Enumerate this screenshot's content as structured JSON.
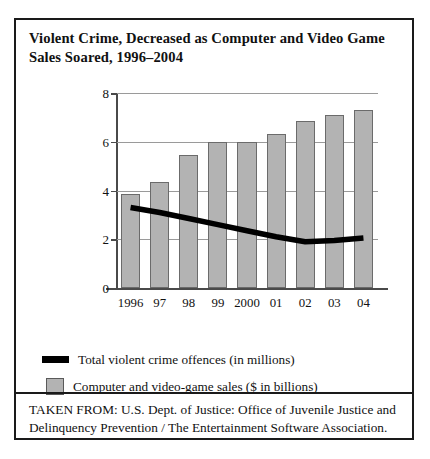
{
  "figure": {
    "title": "Violent Crime, Decreased as Computer and Video Game Sales Soared, 1996–2004",
    "source_note": "TAKEN FROM: U.S. Dept. of Justice: Office of Juvenile Justice and Delinquency Prevention / The Entertainment Software Association."
  },
  "legend": {
    "items": [
      {
        "marker": "line-swatch",
        "label": "Total violent crime offences (in millions)"
      },
      {
        "marker": "box-swatch",
        "label": "Computer and video-game sales ($ in billions)"
      }
    ]
  },
  "colors": {
    "bar_fill": "#b3b3b3",
    "bar_border": "#6b6b6b",
    "line": "#000000",
    "axis": "#4a4a4a",
    "grid": "#9a9a9a",
    "frame": "#1a1a1a",
    "text": "#111111"
  },
  "chart_data": {
    "type": "bar",
    "title": "Violent Crime, Decreased as Computer and Video Game Sales Soared, 1996–2004",
    "subtitle": "",
    "xlabel": "",
    "ylabel": "",
    "categories": [
      "1996",
      "97",
      "98",
      "99",
      "2000",
      "01",
      "02",
      "03",
      "04"
    ],
    "ylim": [
      0,
      8
    ],
    "yticks": [
      0,
      2,
      4,
      6,
      8
    ],
    "ytick_labels": [
      "0",
      "2",
      "4",
      "6",
      "8"
    ],
    "grid": true,
    "legend_position": "below",
    "series": [
      {
        "name": "Computer and video-game sales ($ in billions)",
        "type": "bar",
        "values": [
          3.85,
          4.35,
          5.45,
          6.0,
          6.0,
          6.3,
          6.85,
          7.1,
          7.3
        ]
      },
      {
        "name": "Total violent crime offences (in millions)",
        "type": "line",
        "values": [
          3.3,
          3.1,
          2.85,
          2.6,
          2.35,
          2.1,
          1.9,
          1.95,
          2.05
        ]
      }
    ]
  }
}
